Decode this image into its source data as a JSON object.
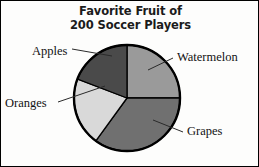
{
  "title": {
    "line1": "Favorite Fruit of",
    "line2": "200 Soccer Players"
  },
  "chart_data": {
    "type": "pie",
    "title": "Favorite Fruit of 200 Soccer Players",
    "xlabel": "",
    "ylabel": "",
    "total": 200,
    "total_unit": "Soccer Players",
    "legend_position": "none",
    "labels_position": "outside-with-leader-lines",
    "grid": false,
    "start_angle_deg": 0,
    "direction": "clockwise",
    "categories": [
      "Watermelon",
      "Grapes",
      "Oranges",
      "Apples"
    ],
    "values": [
      50,
      70,
      42,
      38
    ],
    "percentages": [
      25,
      35,
      21,
      19
    ],
    "slices": [
      {
        "label": "Watermelon",
        "value": 50,
        "percent": 25,
        "start_deg": 0,
        "end_deg": 90,
        "color": "#9a9a9a"
      },
      {
        "label": "Grapes",
        "value": 70,
        "percent": 35,
        "start_deg": 90,
        "end_deg": 216,
        "color": "#707070"
      },
      {
        "label": "Oranges",
        "value": 42,
        "percent": 21,
        "start_deg": 216,
        "end_deg": 291,
        "color": "#d9d9d9"
      },
      {
        "label": "Apples",
        "value": 38,
        "percent": 19,
        "start_deg": 291,
        "end_deg": 360,
        "color": "#4a4a4a"
      }
    ]
  },
  "labels": {
    "apples": "Apples",
    "oranges": "Oranges",
    "watermelon": "Watermelon",
    "grapes": "Grapes"
  },
  "colors": {
    "watermelon": "#9a9a9a",
    "grapes": "#707070",
    "oranges": "#d9d9d9",
    "apples": "#4a4a4a",
    "outline": "#000000",
    "background": "#fdfdfc",
    "text": "#121212"
  }
}
